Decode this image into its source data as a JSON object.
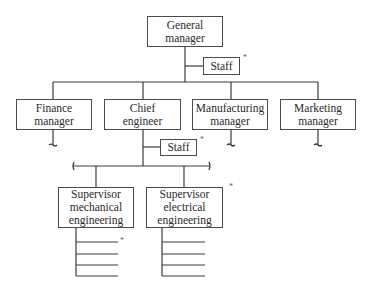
{
  "diagram": {
    "type": "organization-chart",
    "line_color": "#3a3a3a",
    "nodes": [
      {
        "id": "gm",
        "label": "General\nmanager",
        "x": 147,
        "y": 16,
        "w": 76,
        "h": 31
      },
      {
        "id": "staff1",
        "label": "Staff",
        "x": 203,
        "y": 57,
        "w": 37,
        "h": 18,
        "asterisk": true
      },
      {
        "id": "finance",
        "label": "Finance\nmanager",
        "x": 16,
        "y": 99,
        "w": 76,
        "h": 31
      },
      {
        "id": "chief",
        "label": "Chief\nengineer",
        "x": 104,
        "y": 99,
        "w": 77,
        "h": 31
      },
      {
        "id": "manufacturing",
        "label": "Manufacturing\nmanager",
        "x": 192,
        "y": 99,
        "w": 76,
        "h": 31
      },
      {
        "id": "marketing",
        "label": "Marketing\nmanager",
        "x": 280,
        "y": 99,
        "w": 76,
        "h": 31
      },
      {
        "id": "staff2",
        "label": "Staff",
        "x": 160,
        "y": 139,
        "w": 37,
        "h": 17,
        "asterisk": true
      },
      {
        "id": "sup_mech",
        "label": "Supervisor\nmechanical\nengineering",
        "x": 58,
        "y": 187,
        "w": 76,
        "h": 41
      },
      {
        "id": "sup_elec",
        "label": "Supervisor\nelectrical\nengineering",
        "x": 146,
        "y": 187,
        "w": 77,
        "h": 41,
        "asterisk": true
      }
    ],
    "asterisks": [
      {
        "x": 243,
        "y": 54,
        "text": "*"
      },
      {
        "x": 200,
        "y": 136,
        "text": "*"
      },
      {
        "x": 229,
        "y": 183,
        "text": "*"
      },
      {
        "x": 120,
        "y": 237,
        "text": "*"
      }
    ]
  },
  "labels": {
    "gm": "General\nmanager",
    "staff1": "Staff",
    "finance": "Finance\nmanager",
    "chief": "Chief\nengineer",
    "manufacturing": "Manufacturing\nmanager",
    "marketing": "Marketing\nmanager",
    "staff2": "Staff",
    "sup_mech": "Supervisor\nmechanical\nengineering",
    "sup_elec": "Supervisor\nelectrical\nengineering",
    "asterisk": "*"
  }
}
